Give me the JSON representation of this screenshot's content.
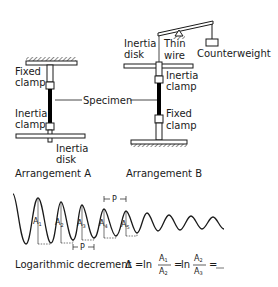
{
  "arrangement_a": {
    "caption": "Arrangement A",
    "fixed_clamp_line1": "Fixed",
    "fixed_clamp_line2": "clamp",
    "inertia_clamp_line1": "Inertia",
    "inertia_clamp_line2": "clamp",
    "inertia_disk_line1": "Inertia",
    "inertia_disk_line2": "disk"
  },
  "specimen_label": "Specimen",
  "arrangement_b": {
    "caption": "Arrangement B",
    "inertia_disk_line1": "Inertia",
    "inertia_disk_line2": "disk",
    "thin_wire_line1": "Thin",
    "thin_wire_line2": "wire",
    "counterweight": "Counterweight",
    "inertia_clamp_line1": "Inertia",
    "inertia_clamp_line2": "clamp",
    "fixed_clamp_line1": "Fixed",
    "fixed_clamp_line2": "clamp"
  },
  "waveform": {
    "amplitude_labels": [
      "A",
      "A",
      "A",
      "A",
      "A"
    ],
    "amplitude_subscripts": [
      "1",
      "2",
      "3",
      "4",
      "5"
    ],
    "period_label": "P"
  },
  "formula": {
    "text": "Logarithmic decrement",
    "delta": "Δ",
    "equals": "=",
    "ln": "ln",
    "num1": "A",
    "num1_sub": "1",
    "den1": "A",
    "den1_sub": "2",
    "num2": "A",
    "num2_sub": "2",
    "den2": "A",
    "den2_sub": "3",
    "ellipsis": "____"
  },
  "colors": {
    "line": "#1a1a1a",
    "specimen": "#000000",
    "background": "#ffffff"
  }
}
